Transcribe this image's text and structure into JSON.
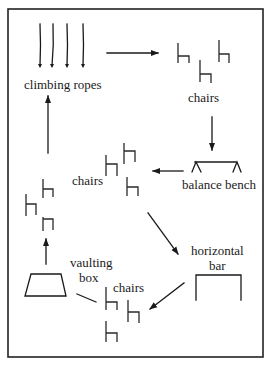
{
  "diagram": {
    "type": "circuit-training-layout",
    "stations": [
      {
        "id": "climbing-ropes",
        "label": "climbing ropes"
      },
      {
        "id": "chairs-top",
        "label": "chairs"
      },
      {
        "id": "balance-bench",
        "label": "balance bench"
      },
      {
        "id": "chairs-middle",
        "label": "chairs"
      },
      {
        "id": "horizontal-bar",
        "label_line1": "horizontal",
        "label_line2": "bar"
      },
      {
        "id": "chairs-bottom",
        "label": "chairs"
      },
      {
        "id": "vaulting-box",
        "label_line1": "vaulting",
        "label_line2": "box"
      },
      {
        "id": "chairs-left",
        "label": ""
      }
    ],
    "flow": [
      "climbing-ropes -> chairs-top",
      "chairs-top -> balance-bench",
      "balance-bench -> chairs-middle",
      "chairs-middle -> horizontal-bar",
      "horizontal-bar -> chairs-bottom",
      "vaulting-box -> chairs-left",
      "chairs-left -> climbing-ropes"
    ],
    "colors": {
      "ink": "#1a1a1a",
      "background": "#ffffff"
    }
  }
}
